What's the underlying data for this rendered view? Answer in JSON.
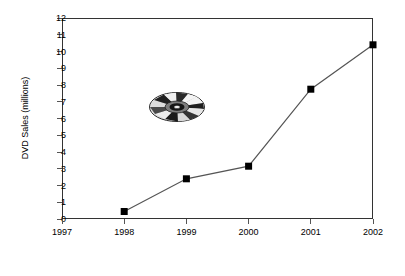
{
  "chart_data": {
    "type": "line",
    "title": "",
    "xlabel": "Year",
    "ylabel": "DVD Sales (millions)",
    "x": [
      1998,
      1999,
      2000,
      2001,
      2002
    ],
    "values": [
      0.45,
      2.4,
      3.15,
      7.75,
      10.4
    ],
    "series": [
      {
        "name": "DVD Sales",
        "values": [
          0.45,
          2.4,
          3.15,
          7.75,
          10.4
        ]
      }
    ],
    "x_tick_labels": [
      "1997",
      "1998",
      "1999",
      "2000",
      "2001",
      "2002"
    ],
    "y_tick_labels": [
      "0",
      "1",
      "2",
      "3",
      "4",
      "5",
      "6",
      "7",
      "8",
      "9",
      "10",
      "11",
      "12"
    ],
    "xlim": [
      1997,
      2002
    ],
    "ylim": [
      0,
      12
    ],
    "grid": false,
    "legend": "none",
    "marker": "square",
    "marker_color": "#000000",
    "line_color": "#555555",
    "frame_color": "#333333",
    "background": "#ffffff"
  },
  "decoration": {
    "dvd_disc_label": "dvd-disc-clipart"
  }
}
